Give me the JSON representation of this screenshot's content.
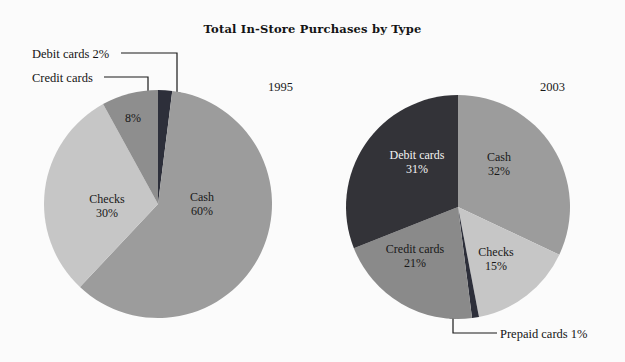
{
  "chart_data": {
    "type": "pie",
    "title": "Total In-Store Purchases by Type",
    "xlabel": "",
    "ylabel": "",
    "legend_position": "none",
    "grid": false,
    "units": "percent",
    "panels": [
      {
        "name": "1995",
        "year_label": "1995",
        "categories": [
          "Debit cards",
          "Cash",
          "Checks",
          "Credit cards"
        ],
        "values": [
          2,
          60,
          30,
          8
        ],
        "colors": [
          "#2d2f3a",
          "#9c9c9c",
          "#c6c6c6",
          "#8e8e8e"
        ],
        "start_angle_deg": 0,
        "slices": [
          {
            "label": "Debit cards",
            "value": 2,
            "value_text": "2%",
            "color": "#2d2f3a",
            "label_placement": "callout",
            "callout_text": "Debit cards 2%"
          },
          {
            "label": "Cash",
            "value": 60,
            "value_text": "60%",
            "color": "#9c9c9c",
            "label_placement": "inside",
            "text_color": "#181818"
          },
          {
            "label": "Checks",
            "value": 30,
            "value_text": "30%",
            "color": "#c6c6c6",
            "label_placement": "inside",
            "text_color": "#181818"
          },
          {
            "label": "Credit cards",
            "value": 8,
            "value_text": "8%",
            "color": "#8e8e8e",
            "label_placement": "callout-pct-inside",
            "callout_text": "Credit cards"
          }
        ]
      },
      {
        "name": "2003",
        "year_label": "2003",
        "categories": [
          "Cash",
          "Checks",
          "Prepaid cards",
          "Credit cards",
          "Debit cards"
        ],
        "values": [
          32,
          15,
          1,
          21,
          31
        ],
        "colors": [
          "#9c9c9c",
          "#c6c6c6",
          "#2d2f3a",
          "#8a8a8a",
          "#333338"
        ],
        "start_angle_deg": 0,
        "slices": [
          {
            "label": "Cash",
            "value": 32,
            "value_text": "32%",
            "color": "#9c9c9c",
            "label_placement": "inside",
            "text_color": "#181818"
          },
          {
            "label": "Checks",
            "value": 15,
            "value_text": "15%",
            "color": "#c6c6c6",
            "label_placement": "inside",
            "text_color": "#181818"
          },
          {
            "label": "Prepaid cards",
            "value": 1,
            "value_text": "1%",
            "color": "#2d2f3a",
            "label_placement": "callout",
            "callout_text": "Prepaid cards 1%"
          },
          {
            "label": "Credit cards",
            "value": 21,
            "value_text": "21%",
            "color": "#8a8a8a",
            "label_placement": "inside",
            "text_color": "#181818"
          },
          {
            "label": "Debit cards",
            "value": 31,
            "value_text": "31%",
            "color": "#333338",
            "label_placement": "inside",
            "text_color": "#f4f4f4"
          }
        ]
      }
    ]
  },
  "labels": {
    "panel0": {
      "cash_name": "Cash",
      "cash_pct": "60%",
      "checks_name": "Checks",
      "checks_pct": "30%",
      "credit_pct": "8%",
      "callout_debit": "Debit cards 2%",
      "callout_credit": "Credit cards"
    },
    "panel1": {
      "cash_name": "Cash",
      "cash_pct": "32%",
      "checks_name": "Checks",
      "checks_pct": "15%",
      "credit_name": "Credit cards",
      "credit_pct": "21%",
      "debit_name": "Debit cards",
      "debit_pct": "31%",
      "callout_prepaid": "Prepaid cards 1%"
    }
  },
  "colors": {
    "background": "#fbfbfb",
    "cash": "#9c9c9c",
    "checks": "#c6c6c6",
    "credit_1995": "#8e8e8e",
    "credit_2003": "#8a8a8a",
    "debit_1995": "#2d2f3a",
    "debit_2003": "#333338",
    "prepaid": "#2d2f3a",
    "leader_line": "#1a1a1a",
    "text": "#1a1a1a"
  }
}
